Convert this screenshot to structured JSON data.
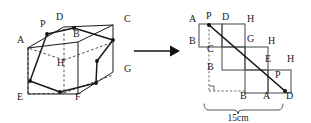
{
  "diagram": {
    "colors": {
      "ink": "#1a1a1a",
      "net_ink": "#555555",
      "hidden": "#3a3a3a",
      "background": "#ffffff"
    },
    "arrow": {
      "name": "transform-arrow",
      "glyph": "→"
    },
    "cube": {
      "name": "cube-figure",
      "vertex_labels": [
        {
          "id": "A",
          "text": "A",
          "x": 17,
          "y": 43
        },
        {
          "id": "B",
          "text": "B",
          "x": 73,
          "y": 37
        },
        {
          "id": "C",
          "text": "C",
          "x": 124,
          "y": 22
        },
        {
          "id": "D",
          "text": "D",
          "x": 56,
          "y": 20
        },
        {
          "id": "E",
          "text": "E",
          "x": 17,
          "y": 100
        },
        {
          "id": "F",
          "text": "F",
          "x": 75,
          "y": 100
        },
        {
          "id": "G",
          "text": "G",
          "x": 124,
          "y": 72
        },
        {
          "id": "H",
          "text": "H",
          "x": 57,
          "y": 66
        },
        {
          "id": "P",
          "text": "P",
          "x": 40,
          "y": 27
        }
      ],
      "marked_point_count": 6
    },
    "net": {
      "name": "unfolded-net-figure",
      "vertex_labels": [
        {
          "id": "A-top-left",
          "text": "A",
          "x": 189,
          "y": 22
        },
        {
          "id": "P-top",
          "text": "P",
          "x": 206,
          "y": 19
        },
        {
          "id": "D-top",
          "text": "D",
          "x": 222,
          "y": 20
        },
        {
          "id": "H-top",
          "text": "H",
          "x": 247,
          "y": 22
        },
        {
          "id": "B-left-upper",
          "text": "B",
          "x": 189,
          "y": 44
        },
        {
          "id": "G-mid",
          "text": "G",
          "x": 247,
          "y": 42
        },
        {
          "id": "H-mid",
          "text": "H",
          "x": 268,
          "y": 44
        },
        {
          "id": "C-inner",
          "text": "C",
          "x": 207,
          "y": 52
        },
        {
          "id": "E-right",
          "text": "E",
          "x": 265,
          "y": 62
        },
        {
          "id": "H-right",
          "text": "H",
          "x": 287,
          "y": 62
        },
        {
          "id": "B-left-lower",
          "text": "B",
          "x": 207,
          "y": 70
        },
        {
          "id": "P-bottom",
          "text": "P",
          "x": 275,
          "y": 78
        },
        {
          "id": "B-bottom",
          "text": "B",
          "x": 240,
          "y": 95
        },
        {
          "id": "A-bottom",
          "text": "A",
          "x": 263,
          "y": 95
        },
        {
          "id": "D-bottom",
          "text": "D",
          "x": 286,
          "y": 95
        }
      ],
      "dimension": {
        "name": "width-dimension",
        "label": "15cm",
        "value": 15,
        "unit": "cm",
        "label_x": 238,
        "label_y": 119
      },
      "right_angle_marker": "right-angle"
    }
  }
}
